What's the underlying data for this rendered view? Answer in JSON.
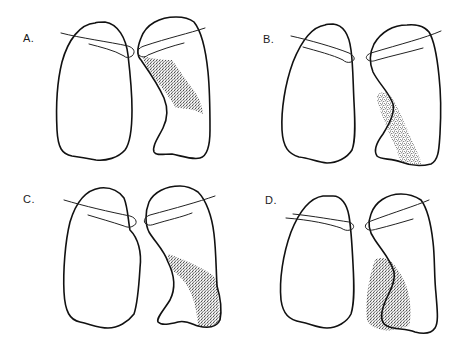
{
  "figure": {
    "ink_color": "#111111",
    "shade_color": "#333333",
    "background": "#ffffff"
  },
  "panels": [
    {
      "id": "A",
      "label": "A.",
      "shading_location": "right lung, upper-middle region adjacent to hilum (perihilar wedge)"
    },
    {
      "id": "B",
      "label": "B.",
      "shading_location": "right lung, lower medial strip extending to base"
    },
    {
      "id": "C",
      "label": "C.",
      "shading_location": "right lung, lower lateral region extending to base"
    },
    {
      "id": "D",
      "label": "D.",
      "shading_location": "right lung, lower medial region overlapping heart border"
    }
  ]
}
